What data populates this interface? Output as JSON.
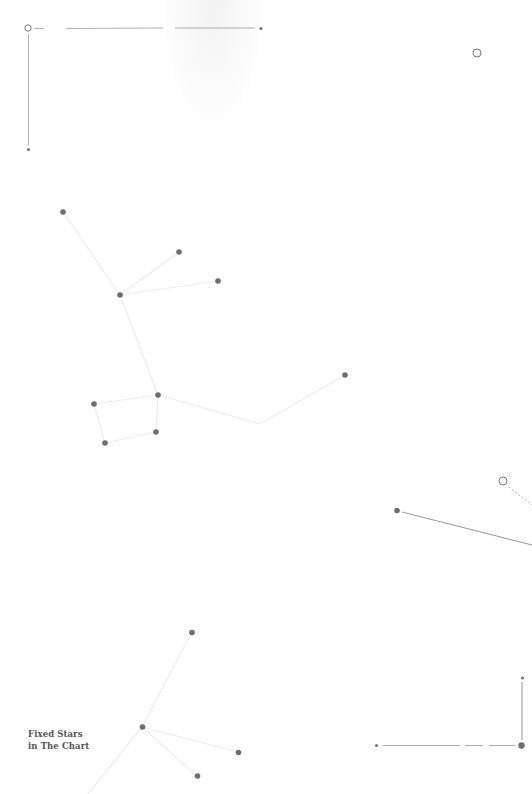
{
  "caption": {
    "line1": "Fixed Stars",
    "line2": "in The Chart"
  },
  "colors": {
    "background": "#ffffff",
    "star": "#6e6e6e",
    "constellation_line": "#ececec",
    "frame_line": "#9a9a9a",
    "caption_text": "#555555"
  },
  "elements": {
    "frame_top_left": {
      "open_circle": [
        28,
        28
      ],
      "horizontal_segments": [
        [
          34,
          44
        ],
        [
          66,
          163
        ],
        [
          175,
          255
        ]
      ],
      "end_dot": [
        261,
        28
      ],
      "vertical_line": [
        [
          28,
          34
        ],
        [
          28,
          146
        ]
      ],
      "bottom_dot": [
        28,
        149
      ]
    },
    "lone_circle": [
      477,
      53
    ],
    "constellation_upper": {
      "stars": [
        [
          63,
          212
        ],
        [
          179,
          252
        ],
        [
          218,
          281
        ],
        [
          120,
          295
        ],
        [
          158,
          395
        ],
        [
          94,
          404
        ],
        [
          156,
          432
        ],
        [
          105,
          443
        ],
        [
          345,
          375
        ]
      ],
      "vertex": [
        260,
        424
      ]
    },
    "right_circle": [
      503,
      481
    ],
    "right_line": {
      "dot": [
        397,
        510
      ],
      "to": [
        532,
        545
      ]
    },
    "frame_bottom_right": {
      "start_dot": [
        376,
        745
      ],
      "horizontal_segments": [
        [
          383,
          460
        ],
        [
          465,
          483
        ],
        [
          489,
          515
        ]
      ],
      "corner_dot": [
        521,
        745
      ],
      "vertical_line": [
        [
          522,
          682
        ],
        [
          522,
          740
        ]
      ],
      "top_dot": [
        522,
        678
      ]
    },
    "constellation_lower": {
      "stars": [
        [
          192,
          632
        ],
        [
          142,
          727
        ],
        [
          238,
          752
        ],
        [
          197,
          776
        ]
      ],
      "tail_end": [
        88,
        794
      ]
    }
  }
}
